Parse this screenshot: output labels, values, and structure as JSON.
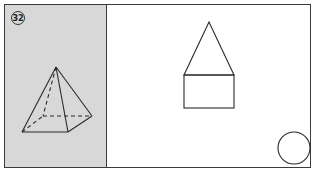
{
  "problem": {
    "number_label": "32"
  },
  "colors": {
    "left_panel_bg": "#d8d8d8",
    "line": "#2a2a2a",
    "background": "#ffffff"
  },
  "solid": {
    "type": "square pyramid",
    "apex": [
      56,
      67
    ],
    "base_front_left": [
      22,
      132
    ],
    "base_front_right": [
      68,
      132
    ],
    "base_back_right": [
      92,
      116
    ],
    "base_back_left": [
      43,
      116
    ],
    "hidden_edges": [
      "apex-back_left",
      "front_left-back_left",
      "back_left-back_right"
    ]
  },
  "views": {
    "front_view": {
      "shape": "triangle on rectangle",
      "triangle_apex": [
        209,
        22
      ],
      "rect": {
        "x": 184,
        "y": 75,
        "w": 50,
        "h": 33
      }
    },
    "top_view": {
      "shape": "circle",
      "center": [
        294,
        148
      ],
      "r": 16
    }
  }
}
